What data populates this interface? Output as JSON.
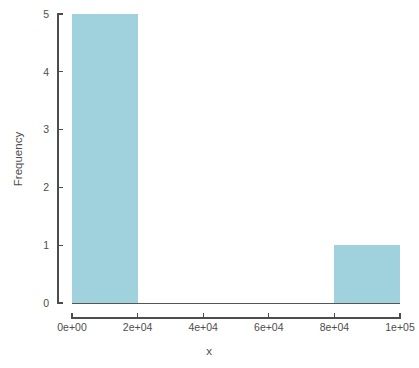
{
  "chart_data": {
    "type": "bar",
    "title": "",
    "subtitle": "",
    "xlabel": "x",
    "ylabel": "Frequency",
    "xlim": [
      0,
      100000
    ],
    "ylim": [
      0,
      5
    ],
    "grid": false,
    "legend": null,
    "bar_color": "#9fd2dc",
    "axis_color": "#4d4d4d",
    "background": "#ffffff",
    "bins": [
      {
        "label": "0 - 20000",
        "bin_start": 0,
        "bin_end": 20000,
        "value": 5
      },
      {
        "label": "80000 - 100000",
        "bin_start": 80000,
        "bin_end": 100000,
        "value": 1
      }
    ],
    "categories": [
      "0 - 20000",
      "80000 - 100000"
    ],
    "values": [
      5,
      1
    ],
    "xticks": [
      {
        "value": 0,
        "label": "0e+00"
      },
      {
        "value": 20000,
        "label": "2e+04"
      },
      {
        "value": 40000,
        "label": "4e+04"
      },
      {
        "value": 60000,
        "label": "6e+04"
      },
      {
        "value": 80000,
        "label": "8e+04"
      },
      {
        "value": 100000,
        "label": "1e+05"
      }
    ],
    "yticks": [
      {
        "value": 0,
        "label": "0"
      },
      {
        "value": 1,
        "label": "1"
      },
      {
        "value": 2,
        "label": "2"
      },
      {
        "value": 3,
        "label": "3"
      },
      {
        "value": 4,
        "label": "4"
      },
      {
        "value": 5,
        "label": "5"
      }
    ]
  }
}
